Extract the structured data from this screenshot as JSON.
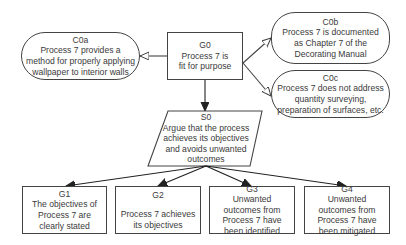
{
  "diagram": {
    "notation": "GSN",
    "nodes": {
      "G0": {
        "id": "G0",
        "type": "goal",
        "text": "Process 7 is fit for purpose",
        "lines": [
          "Process 7 is",
          "fit for purpose"
        ]
      },
      "C0a": {
        "id": "C0a",
        "type": "context",
        "text": "Process 7 provides a method for properly applying wallpaper to interior walls"
      },
      "C0b": {
        "id": "C0b",
        "type": "context",
        "text": "Process 7 is documented as Chapter 7 of the Decorating Manual"
      },
      "C0c": {
        "id": "C0c",
        "type": "context",
        "text": "Process 7 does not address quantity surveying, preparation of surfaces, etc."
      },
      "S0": {
        "id": "S0",
        "type": "strategy",
        "text": "Argue that the process achieves its objectives and avoids unwanted outcomes"
      },
      "G1": {
        "id": "G1",
        "type": "goal",
        "text": "The objectives of Process 7 are clearly stated"
      },
      "G2": {
        "id": "G2",
        "type": "goal",
        "text": "Process 7 achieves its objectives"
      },
      "G3": {
        "id": "G3",
        "type": "goal",
        "text": "Unwanted outcomes from Process 7 have been identified"
      },
      "G4": {
        "id": "G4",
        "type": "goal",
        "text": "Unwanted outcomes from Process 7 have been mitigated"
      }
    },
    "edges": [
      {
        "from": "G0",
        "to": "C0a",
        "kind": "in-context-of"
      },
      {
        "from": "G0",
        "to": "C0b",
        "kind": "in-context-of"
      },
      {
        "from": "G0",
        "to": "C0c",
        "kind": "in-context-of"
      },
      {
        "from": "G0",
        "to": "S0",
        "kind": "supported-by"
      },
      {
        "from": "S0",
        "to": "G1",
        "kind": "supported-by"
      },
      {
        "from": "S0",
        "to": "G2",
        "kind": "supported-by"
      },
      {
        "from": "S0",
        "to": "G3",
        "kind": "supported-by"
      },
      {
        "from": "S0",
        "to": "G4",
        "kind": "supported-by"
      }
    ],
    "colors": {
      "stroke": "#444444",
      "text": "#3a3a3a",
      "background": "#ffffff"
    }
  }
}
